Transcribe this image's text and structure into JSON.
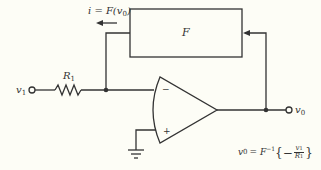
{
  "diagram": {
    "type": "circuit",
    "colors": {
      "background": "#fdfdf6",
      "line": "#333333"
    },
    "blocks": [
      {
        "id": "F",
        "label": "F"
      }
    ],
    "labels": {
      "current": "i = F(v",
      "current_sub": "0",
      "current_end": ")",
      "resistor": "R",
      "resistor_sub": "1",
      "input": "v",
      "input_sub": "1",
      "output": "v",
      "output_sub": "0",
      "opamp_minus": "−",
      "opamp_plus": "+",
      "equation_lhs": "v",
      "equation_lhs_sub": "0",
      "equation_mid": " = F",
      "equation_sup": "−1",
      "equation_open": "{−",
      "equation_num": "v",
      "equation_num_sub": "1",
      "equation_den": "R",
      "equation_den_sub": "1",
      "equation_close": "}"
    },
    "components": [
      "input terminal v1",
      "resistor R1",
      "op-amp (inverting)",
      "function block F",
      "ground",
      "output terminal v0"
    ]
  }
}
